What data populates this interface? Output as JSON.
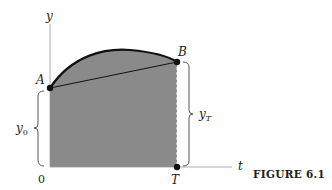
{
  "figure": {
    "caption": "FIGURE 6.1",
    "axes": {
      "y_label": "y",
      "x_label": "t",
      "origin_label": "0"
    },
    "points": {
      "A": "A",
      "B": "B",
      "T": "T"
    },
    "braces": {
      "left": {
        "label_main": "y",
        "label_sub": "0"
      },
      "right": {
        "label_main": "y",
        "label_sub": "T"
      }
    },
    "colors": {
      "fill": "#8a8a8a",
      "curve": "#111111",
      "axis": "#888888",
      "text": "#222222"
    }
  }
}
